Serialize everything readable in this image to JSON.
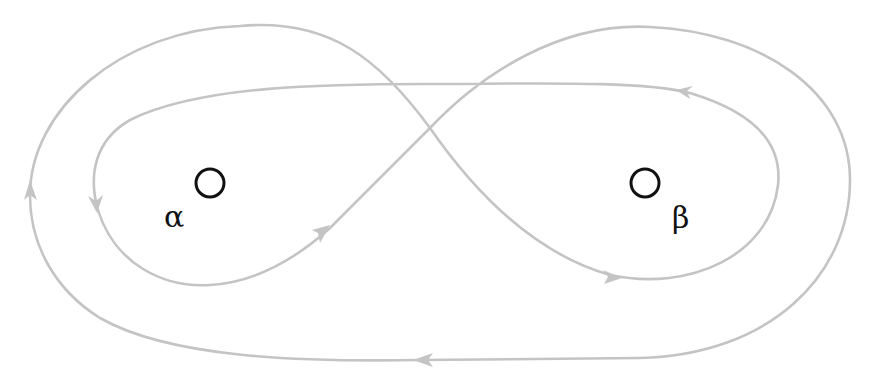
{
  "diagram": {
    "type": "phase-portrait-figure-eight",
    "stroke_color": "#c4c4c4",
    "points": [
      {
        "id": "alpha",
        "label": "α",
        "cx": 210,
        "cy": 183
      },
      {
        "id": "beta",
        "label": "β",
        "cx": 645,
        "cy": 183
      }
    ],
    "arrows": [
      {
        "location": "outer-left",
        "direction": "up"
      },
      {
        "location": "outer-bottom",
        "direction": "left"
      },
      {
        "location": "inner-left-loop",
        "direction": "down"
      },
      {
        "location": "diagonal-alpha-to-top",
        "direction": "up-right"
      },
      {
        "location": "inner-right-top",
        "direction": "left"
      },
      {
        "location": "beta-loop-bottom",
        "direction": "right"
      }
    ]
  }
}
